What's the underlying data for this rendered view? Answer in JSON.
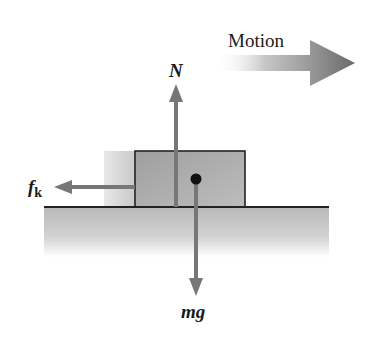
{
  "diagram": {
    "type": "free-body-diagram",
    "motion_label": "Motion",
    "forces": [
      {
        "id": "normal",
        "label": "N",
        "direction": "up"
      },
      {
        "id": "gravity",
        "label": "mg",
        "direction": "down"
      },
      {
        "id": "kinetic-friction",
        "label": "f",
        "subscript": "k",
        "direction": "left"
      }
    ],
    "colors": {
      "arrow": "#777777",
      "box_fill": "#a8a8a8",
      "outline": "#222222",
      "ground": "#c4c4c4"
    }
  }
}
